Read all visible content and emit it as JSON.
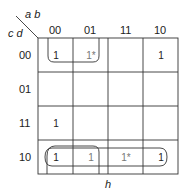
{
  "kmap": {
    "row_var_label": "c d",
    "col_var_label": "a b",
    "col_headers": [
      "00",
      "01",
      "11",
      "10"
    ],
    "row_headers": [
      "00",
      "01",
      "11",
      "10"
    ],
    "cells": [
      [
        "1",
        "1*",
        "",
        "1"
      ],
      [
        "",
        "",
        "",
        ""
      ],
      [
        "1",
        "",
        "",
        ""
      ],
      [
        "1",
        "1",
        "1*",
        "1"
      ]
    ],
    "bottom_label": "h"
  }
}
